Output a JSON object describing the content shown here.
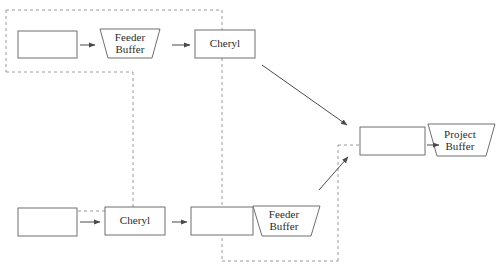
{
  "diagram": {
    "canvas": {
      "width": 502,
      "height": 272
    },
    "colors": {
      "stroke": "#6f6f6f",
      "dashed_stroke": "#8d8d8d",
      "arrow": "#4a4a4a",
      "text": "#2b2b2b",
      "background": "#ffffff"
    },
    "nodes": [
      {
        "id": "top-task-1",
        "shape": "rect",
        "label": "",
        "x": 18,
        "y": 31,
        "w": 59,
        "h": 27
      },
      {
        "id": "top-feeder-buffer",
        "shape": "trapezoid",
        "label": "Feeder\nBuffer",
        "x": 100,
        "y": 29,
        "w": 60,
        "h": 29
      },
      {
        "id": "top-cheryl",
        "shape": "rect",
        "label": "Cheryl",
        "x": 195,
        "y": 30,
        "w": 60,
        "h": 28
      },
      {
        "id": "bottom-task-1",
        "shape": "rect",
        "label": "",
        "x": 18,
        "y": 208,
        "w": 59,
        "h": 28
      },
      {
        "id": "bottom-cheryl",
        "shape": "rect",
        "label": "Cheryl",
        "x": 105,
        "y": 207,
        "w": 60,
        "h": 28
      },
      {
        "id": "bottom-task-2",
        "shape": "rect",
        "label": "",
        "x": 191,
        "y": 207,
        "w": 62,
        "h": 28
      },
      {
        "id": "bottom-feeder-buffer",
        "shape": "trapezoid",
        "label": "Feeder\nBuffer",
        "x": 253,
        "y": 206,
        "w": 67,
        "h": 30
      },
      {
        "id": "merge-task",
        "shape": "rect",
        "label": "",
        "x": 360,
        "y": 127,
        "w": 65,
        "h": 28
      },
      {
        "id": "project-buffer",
        "shape": "trapezoid",
        "label": "Project\nBuffer",
        "x": 428,
        "y": 124,
        "w": 67,
        "h": 32
      }
    ],
    "arrows": [
      {
        "id": "a1",
        "from": "top-task-1",
        "to": "top-feeder-buffer",
        "x1": 80,
        "y1": 45,
        "x2": 97,
        "y2": 45
      },
      {
        "id": "a2",
        "from": "top-feeder-buffer",
        "to": "top-cheryl",
        "x1": 172,
        "y1": 45,
        "x2": 192,
        "y2": 45
      },
      {
        "id": "a3",
        "from": "top-cheryl",
        "to": "merge-task",
        "x1": 262,
        "y1": 65,
        "x2": 349,
        "y2": 126
      },
      {
        "id": "a4",
        "from": "bottom-task-1",
        "to": "bottom-cheryl",
        "x1": 80,
        "y1": 222,
        "x2": 102,
        "y2": 222
      },
      {
        "id": "a5",
        "from": "bottom-cheryl",
        "to": "bottom-task-2",
        "x1": 172,
        "y1": 222,
        "x2": 189,
        "y2": 222
      },
      {
        "id": "a6",
        "from": "bottom-feeder-buffer",
        "to": "merge-task",
        "x1": 320,
        "y1": 190,
        "x2": 349,
        "y2": 157
      },
      {
        "id": "a7",
        "from": "merge-task",
        "to": "project-buffer",
        "x1": 428,
        "y1": 145,
        "x2": 441,
        "y2": 145
      }
    ],
    "dashed_paths": [
      {
        "id": "top-chain-boundary",
        "points": "6,10 222,10"
      },
      {
        "id": "top-chain-left",
        "points": "6,10 6,72"
      },
      {
        "id": "top-chain-bottom",
        "points": "6,72 133,72"
      },
      {
        "id": "critical-chain-vertical-left",
        "points": "133,72 133,211"
      },
      {
        "id": "critical-chain-horizontal-bottom-left",
        "points": "18,211 133,211"
      },
      {
        "id": "critical-chain-vertical-right",
        "points": "222,10 222,261"
      },
      {
        "id": "bottom-chain-bottom",
        "points": "222,261 338,261"
      },
      {
        "id": "bottom-chain-right",
        "points": "338,261 338,145"
      },
      {
        "id": "critical-chain-horizontal-right",
        "points": "338,145 428,145"
      }
    ]
  }
}
